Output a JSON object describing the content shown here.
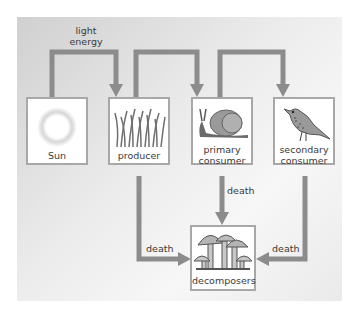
{
  "diagram": {
    "type": "energy flow / food chain",
    "nodes": [
      {
        "id": "sun",
        "label": "Sun",
        "icon": "sun-icon"
      },
      {
        "id": "producer",
        "label": "producer",
        "icon": "grass-icon"
      },
      {
        "id": "primary",
        "label_line1": "primary",
        "label_line2": "consumer",
        "icon": "snail-icon"
      },
      {
        "id": "secondary",
        "label_line1": "secondary",
        "label_line2": "consumer",
        "icon": "bird-icon"
      },
      {
        "id": "decomposers",
        "label": "decomposers",
        "icon": "mushroom-icon"
      }
    ],
    "edges": [
      {
        "from": "sun",
        "to": "producer",
        "label_line1": "light",
        "label_line2": "energy"
      },
      {
        "from": "producer",
        "to": "primary",
        "label": ""
      },
      {
        "from": "primary",
        "to": "secondary",
        "label": ""
      },
      {
        "from": "producer",
        "to": "decomposers",
        "label": "death"
      },
      {
        "from": "primary",
        "to": "decomposers",
        "label": "death"
      },
      {
        "from": "secondary",
        "to": "decomposers",
        "label": "death"
      }
    ],
    "colors": {
      "arrow": "#8c8c8c",
      "box_border": "#a8a8a8",
      "text": "#3a3a3a"
    }
  }
}
